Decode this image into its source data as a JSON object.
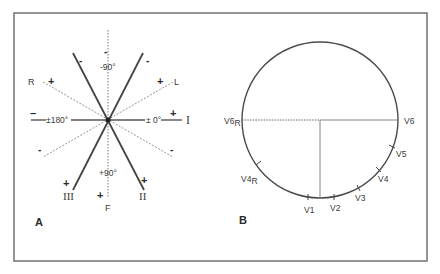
{
  "figure": {
    "frame": {
      "x": 14,
      "y": 13,
      "width": 413,
      "height": 248,
      "stroke": "#707070"
    },
    "panel_a": {
      "label": "A",
      "center": {
        "x": 108,
        "y": 120
      },
      "axis_labels": {
        "minus_90": "-90°",
        "plus_90": "+90°",
        "plus_minus_180": "±180°",
        "plus_minus_0": "± 0°"
      },
      "lead_labels": {
        "I": "I",
        "II": "II",
        "III": "III",
        "R": "R",
        "L": "L",
        "F": "F"
      },
      "signs": {
        "top_vf": "-",
        "top_left_ii": "-",
        "top_right_iii": "-",
        "r_plus": "+",
        "l_plus": "+",
        "i_minus": "–",
        "i_plus": "+",
        "lower_left_l": "-",
        "lower_right_r": "-",
        "iii_plus": "+",
        "f_plus": "+",
        "ii_plus": "+"
      },
      "leads": [
        {
          "name": "I",
          "style": "solid",
          "angle_deg": 0
        },
        {
          "name": "II",
          "style": "solid",
          "angle_deg": 60
        },
        {
          "name": "III",
          "style": "solid",
          "angle_deg": 120
        },
        {
          "name": "aVR",
          "style": "dashed",
          "angle_deg": -150
        },
        {
          "name": "aVL",
          "style": "dashed",
          "angle_deg": -30
        },
        {
          "name": "aVF",
          "style": "dashed",
          "angle_deg": 90
        }
      ]
    },
    "panel_b": {
      "label": "B",
      "circle": {
        "cx": 320,
        "cy": 120,
        "r": 78
      },
      "electrode_labels": {
        "V6R": {
          "main": "V6",
          "sub": "R"
        },
        "V4R": {
          "main": "V4",
          "sub": "R"
        },
        "V6": "V6",
        "V5": "V5",
        "V4": "V4",
        "V3": "V3",
        "V2": "V2",
        "V1": "V1"
      }
    }
  }
}
